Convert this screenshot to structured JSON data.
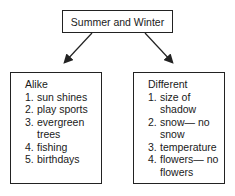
{
  "title": "Summer and Winter",
  "alike": {
    "heading": "Alike",
    "items": [
      {
        "num": "1.",
        "text": "sun shines"
      },
      {
        "num": "2.",
        "text": "play sports"
      },
      {
        "num": "3.",
        "text": "evergreen trees"
      },
      {
        "num": "4.",
        "text": "fishing"
      },
      {
        "num": "5.",
        "text": "birthdays"
      }
    ]
  },
  "different": {
    "heading": "Different",
    "items": [
      {
        "num": "1.",
        "text": "size of shadow"
      },
      {
        "num": "2.",
        "text": "snow— no snow"
      },
      {
        "num": "3.",
        "text": "temperature"
      },
      {
        "num": "4.",
        "text": "flowers— no flowers"
      }
    ]
  }
}
